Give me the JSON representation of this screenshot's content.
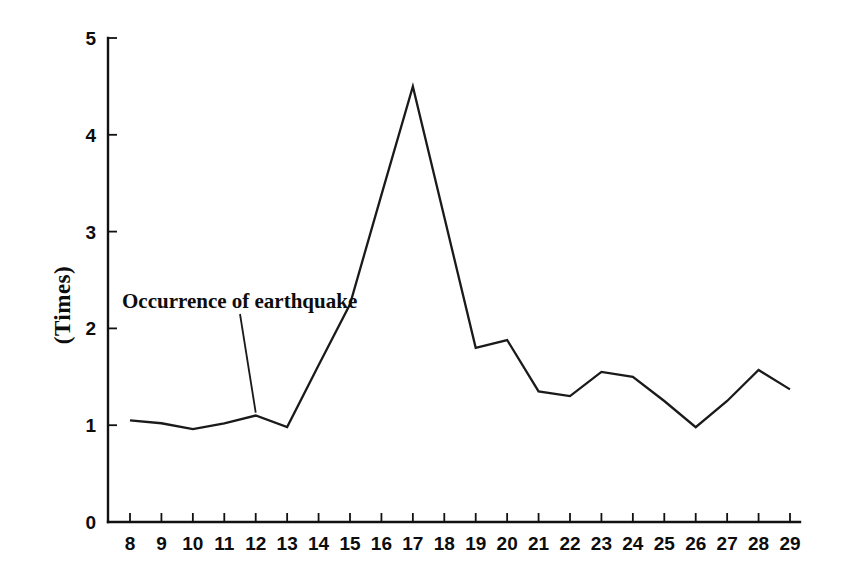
{
  "chart_data": {
    "type": "line",
    "title": "",
    "subtitle": "",
    "xlabel": "",
    "ylabel": "(Times)",
    "x": [
      8,
      9,
      10,
      11,
      12,
      13,
      14,
      15,
      16,
      17,
      18,
      19,
      20,
      21,
      22,
      23,
      24,
      25,
      26,
      27,
      28,
      29
    ],
    "categories": [
      "8",
      "9",
      "10",
      "11",
      "12",
      "13",
      "14",
      "15",
      "16",
      "17",
      "18",
      "19",
      "20",
      "21",
      "22",
      "23",
      "24",
      "25",
      "26",
      "27",
      "28",
      "29"
    ],
    "values": [
      1.05,
      1.02,
      0.96,
      1.02,
      1.1,
      0.98,
      1.62,
      2.25,
      3.38,
      4.5,
      3.15,
      1.8,
      1.88,
      1.35,
      1.3,
      1.55,
      1.5,
      1.25,
      0.98,
      1.25,
      1.57,
      1.37
    ],
    "series": [
      {
        "name": "Occurrence of earthquake",
        "values": [
          1.05,
          1.02,
          0.96,
          1.02,
          1.1,
          0.98,
          1.62,
          2.25,
          3.38,
          4.5,
          3.15,
          1.8,
          1.88,
          1.35,
          1.3,
          1.55,
          1.5,
          1.25,
          0.98,
          1.25,
          1.57,
          1.37
        ]
      }
    ],
    "xlim": [
      8,
      29
    ],
    "ylim": [
      0,
      5
    ],
    "yticks": [
      0,
      1,
      2,
      3,
      4,
      5
    ],
    "ytick_labels": [
      "0",
      "1",
      "2",
      "3",
      "4",
      "5"
    ],
    "xticks": [
      8,
      9,
      10,
      11,
      12,
      13,
      14,
      15,
      16,
      17,
      18,
      19,
      20,
      21,
      22,
      23,
      24,
      25,
      26,
      27,
      28,
      29
    ],
    "grid": false,
    "legend": "none",
    "line_color": "#1a1a1a",
    "background_color": "#ffffff",
    "annotations": [
      {
        "text": "Occurrence of earthquake",
        "points_to_x": 12,
        "points_to_y": 1.1
      }
    ]
  },
  "axes": {
    "y_label": "(Times)",
    "y_tick_labels": [
      "5",
      "4",
      "3",
      "2",
      "1",
      "0"
    ],
    "x_tick_labels": [
      "8",
      "9",
      "10",
      "11",
      "12",
      "13",
      "14",
      "15",
      "16",
      "17",
      "18",
      "19",
      "20",
      "21",
      "22",
      "23",
      "24",
      "25",
      "26",
      "27",
      "28",
      "29"
    ]
  },
  "annotation": {
    "label": "Occurrence of earthquake"
  }
}
